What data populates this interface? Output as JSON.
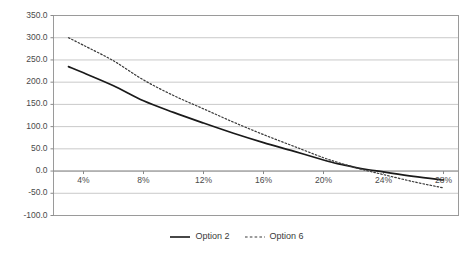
{
  "chart_data": {
    "type": "line",
    "title": "",
    "subtitle": "",
    "xlabel": "",
    "ylabel": "",
    "grid": true,
    "legend_position": "bottom",
    "xlim": [
      2,
      29
    ],
    "ylim": [
      -100,
      350
    ],
    "ytick_labels": [
      "350.0",
      "300.0",
      "250.0",
      "200.0",
      "150.0",
      "100.0",
      "50.0",
      "0.0",
      "-50.0",
      "-100.0"
    ],
    "ytick_values": [
      350,
      300,
      250,
      200,
      150,
      100,
      50,
      0,
      -50,
      -100
    ],
    "xtick_labels": [
      "4%",
      "8%",
      "12%",
      "16%",
      "20%",
      "24%",
      "28%"
    ],
    "xtick_values": [
      4,
      8,
      12,
      16,
      20,
      24,
      28
    ],
    "x": [
      3,
      4,
      6,
      8,
      10,
      12,
      14,
      16,
      18,
      20,
      21,
      22,
      23,
      24,
      26,
      28
    ],
    "series": [
      {
        "name": "Option 2",
        "style": "solid",
        "color": "#1a1a1a",
        "values": [
          235,
          221,
          192,
          158,
          132,
          108,
          85,
          64,
          45,
          25,
          16,
          9,
          3,
          -2,
          -12,
          -20
        ]
      },
      {
        "name": "Option 6",
        "style": "dotted",
        "color": "#3a3a3a",
        "values": [
          300,
          283,
          248,
          205,
          170,
          140,
          110,
          82,
          56,
          30,
          19,
          9,
          0,
          -8,
          -24,
          -38
        ]
      }
    ]
  },
  "legend": {
    "entries": [
      {
        "label": "Option 2",
        "style": "solid"
      },
      {
        "label": "Option 6",
        "style": "dotted"
      }
    ]
  },
  "colors": {
    "grid": "#c9c9c9",
    "axis": "#8a8a8a",
    "plot_border": "#9a9a9a",
    "series_solid": "#1a1a1a",
    "series_dotted": "#3a3a3a",
    "background": "#ffffff"
  }
}
